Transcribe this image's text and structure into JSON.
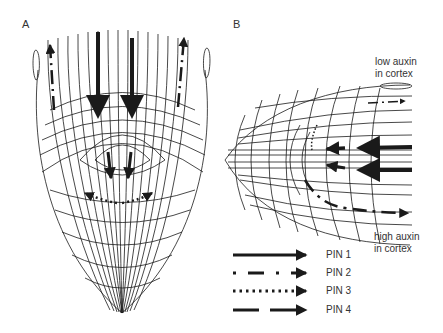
{
  "panels": {
    "a": {
      "label": "A"
    },
    "b": {
      "label": "B"
    }
  },
  "annotations": {
    "low": [
      "low auxin",
      "in cortex"
    ],
    "high": [
      "high auxin",
      "in cortex"
    ]
  },
  "legend": [
    {
      "label": "PIN 1",
      "style": "solid"
    },
    {
      "label": "PIN 2",
      "style": "dash-dot"
    },
    {
      "label": "PIN 3",
      "style": "dotted"
    },
    {
      "label": "PIN 4",
      "style": "long-dash"
    }
  ],
  "colors": {
    "ink": "#1a1a1a",
    "background": "#ffffff"
  }
}
